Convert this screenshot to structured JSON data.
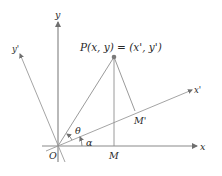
{
  "diagram": {
    "type": "coordinate-rotation",
    "colors": {
      "axis": "#8a8a8a",
      "line": "#8f8f8f",
      "point": "#7a7a7a",
      "text": "#2a2a2a"
    },
    "labels": {
      "point_p": "P(x, y) = (x', y')",
      "origin": "O",
      "x_axis": "x",
      "y_axis": "y",
      "x_prime_axis": "x'",
      "y_prime_axis": "y'",
      "foot_m": "M",
      "foot_m_prime": "M'",
      "angle_theta": "θ",
      "angle_alpha": "α"
    },
    "points": {
      "origin": [
        58,
        146
      ],
      "P": [
        114,
        57
      ],
      "M": [
        114,
        146
      ],
      "M_prime": [
        135,
        111
      ]
    }
  }
}
